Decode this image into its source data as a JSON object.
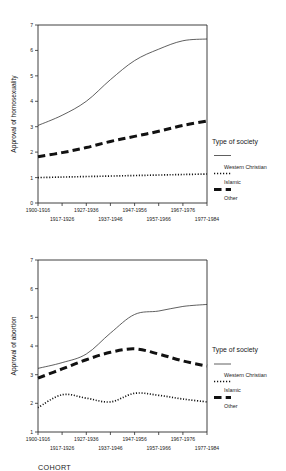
{
  "figure": {
    "background": "#ffffff",
    "ink": "#1a1a1a",
    "cohort_axis_label": "COHORT"
  },
  "legend": {
    "title": "Type of society",
    "entries": [
      {
        "label": "Western Christian",
        "style": "thin-solid-line"
      },
      {
        "label": "Islamic",
        "style": "fine-dotted-line"
      },
      {
        "label": "Other",
        "style": "thick-dashed-line"
      }
    ]
  },
  "panels": [
    {
      "id": "homosexuality",
      "ylabel": "Approval of homosexuality"
    },
    {
      "id": "abortion",
      "ylabel": "Approval of abortion"
    }
  ],
  "chart_data": [
    {
      "type": "line",
      "title": "",
      "xlabel": "COHORT",
      "ylabel": "Approval of homosexuality",
      "categories": [
        "1900-1916",
        "1917-1926",
        "1927-1936",
        "1937-1946",
        "1947-1956",
        "1957-1966",
        "1967-1976",
        "1977-1984"
      ],
      "xticklabels_staggered": true,
      "ylim": [
        0,
        7
      ],
      "yticks": [
        0,
        1,
        2,
        3,
        4,
        5,
        6,
        7
      ],
      "grid": false,
      "legend_title": "Type of society",
      "legend_position": "right",
      "series": [
        {
          "name": "Western Christian",
          "style": "thin-solid-line",
          "values": [
            3.05,
            3.45,
            4.0,
            4.85,
            5.6,
            6.05,
            6.38,
            6.45
          ]
        },
        {
          "name": "Islamic",
          "style": "fine-dotted-line",
          "values": [
            1.0,
            1.02,
            1.04,
            1.06,
            1.08,
            1.1,
            1.12,
            1.14
          ]
        },
        {
          "name": "Other",
          "style": "thick-dashed-line",
          "values": [
            1.82,
            1.98,
            2.18,
            2.42,
            2.62,
            2.82,
            3.05,
            3.22
          ]
        }
      ]
    },
    {
      "type": "line",
      "title": "",
      "xlabel": "COHORT",
      "ylabel": "Approval of abortion",
      "categories": [
        "1900-1916",
        "1917-1926",
        "1927-1936",
        "1937-1946",
        "1947-1956",
        "1957-1966",
        "1967-1976",
        "1977-1984"
      ],
      "xticklabels_staggered": true,
      "ylim": [
        1,
        7
      ],
      "yticks": [
        1,
        2,
        3,
        4,
        5,
        6,
        7
      ],
      "grid": false,
      "legend_title": "Type of society",
      "legend_position": "right",
      "series": [
        {
          "name": "Western Christian",
          "style": "thin-solid-line",
          "values": [
            3.22,
            3.42,
            3.72,
            4.45,
            5.1,
            5.22,
            5.38,
            5.45
          ]
        },
        {
          "name": "Islamic",
          "style": "fine-dotted-line",
          "values": [
            1.85,
            2.3,
            2.18,
            2.05,
            2.35,
            2.28,
            2.15,
            2.05
          ]
        },
        {
          "name": "Other",
          "style": "thick-dashed-line",
          "values": [
            2.88,
            3.2,
            3.52,
            3.78,
            3.9,
            3.72,
            3.48,
            3.3
          ]
        }
      ]
    }
  ]
}
